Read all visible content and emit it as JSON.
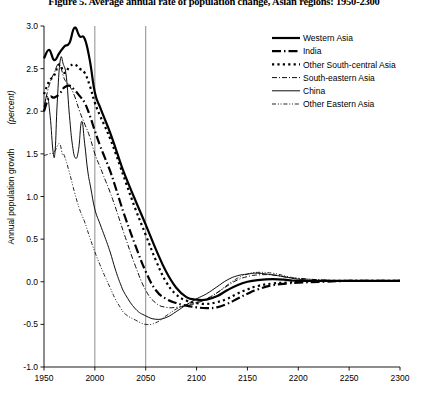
{
  "title": "Figure 5. Average annual rate of population change, Asian regions: 1950-2300",
  "chart_data": {
    "type": "line",
    "title": "Figure 5. Average annual rate of population change, Asian regions: 1950-2300",
    "xlabel": "",
    "ylabel": "Annual population growth",
    "ylabel_unit": "(percent)",
    "xlim": [
      1950,
      2300
    ],
    "ylim": [
      -1.0,
      3.0
    ],
    "xticks": [
      1950,
      2000,
      2050,
      2100,
      2150,
      2200,
      2250,
      2300
    ],
    "yticks": [
      -1.0,
      -0.5,
      0.0,
      0.5,
      1.0,
      1.5,
      2.0,
      2.5,
      3.0
    ],
    "xtick_labels": [
      "1950",
      "2000",
      "2050",
      "2100",
      "2150",
      "2200",
      "2250",
      "2300"
    ],
    "ytick_labels": [
      "-1.0",
      "-0.5",
      "0.0",
      "0.5",
      "1.0",
      "1.5",
      "2.0",
      "2.5",
      "3.0"
    ],
    "grid": "vertical-at-2000-and-2050",
    "gridlines_x": [
      2000,
      2050
    ],
    "gridline_color": "#808080",
    "legend_position": "top-right",
    "line_color": "#000000",
    "series": [
      {
        "name": "Western Asia",
        "style": "solid-thick",
        "stroke_width": 2.2,
        "dasharray": "",
        "x": [
          1950,
          1955,
          1960,
          1965,
          1970,
          1975,
          1980,
          1985,
          1990,
          1995,
          2000,
          2005,
          2010,
          2015,
          2020,
          2025,
          2030,
          2040,
          2050,
          2060,
          2070,
          2080,
          2090,
          2100,
          2110,
          2120,
          2130,
          2140,
          2150,
          2160,
          2175,
          2190,
          2200,
          2225,
          2250,
          2275,
          2300
        ],
        "y": [
          2.62,
          2.72,
          2.6,
          2.68,
          2.76,
          2.8,
          2.98,
          2.88,
          2.85,
          2.6,
          2.22,
          2.05,
          1.9,
          1.75,
          1.58,
          1.4,
          1.24,
          0.95,
          0.67,
          0.38,
          0.12,
          -0.07,
          -0.18,
          -0.21,
          -0.21,
          -0.17,
          -0.1,
          -0.04,
          0.0,
          0.02,
          0.03,
          0.02,
          0.01,
          0.01,
          0.01,
          0.01,
          0.01
        ]
      },
      {
        "name": "India",
        "style": "dash-dot-thick",
        "stroke_width": 2.2,
        "dasharray": "9,3,1.5,3",
        "x": [
          1950,
          1955,
          1960,
          1965,
          1970,
          1975,
          1980,
          1985,
          1990,
          1995,
          2000,
          2005,
          2010,
          2015,
          2020,
          2025,
          2030,
          2040,
          2050,
          2060,
          2070,
          2080,
          2090,
          2100,
          2110,
          2120,
          2130,
          2140,
          2150,
          2160,
          2175,
          2190,
          2200,
          2225,
          2250,
          2275,
          2300
        ],
        "y": [
          2.0,
          2.16,
          2.16,
          2.2,
          2.28,
          2.3,
          2.25,
          2.18,
          2.1,
          1.95,
          1.77,
          1.6,
          1.45,
          1.3,
          1.12,
          0.93,
          0.75,
          0.42,
          0.12,
          -0.1,
          -0.2,
          -0.25,
          -0.28,
          -0.3,
          -0.31,
          -0.3,
          -0.26,
          -0.2,
          -0.14,
          -0.09,
          -0.04,
          -0.02,
          -0.01,
          0.0,
          0.01,
          0.01,
          0.01
        ]
      },
      {
        "name": "Other South-central Asia",
        "style": "dotted-thick",
        "stroke_width": 2.2,
        "dasharray": "2.2,3.2",
        "x": [
          1950,
          1955,
          1960,
          1965,
          1970,
          1975,
          1980,
          1985,
          1990,
          1995,
          2000,
          2005,
          2010,
          2015,
          2020,
          2025,
          2030,
          2040,
          2050,
          2060,
          2070,
          2080,
          2090,
          2100,
          2110,
          2120,
          2130,
          2140,
          2150,
          2160,
          2175,
          2190,
          2200,
          2225,
          2250,
          2275,
          2300
        ],
        "y": [
          2.2,
          2.35,
          2.42,
          2.55,
          2.45,
          2.52,
          2.55,
          2.5,
          2.45,
          2.3,
          2.1,
          1.95,
          1.82,
          1.68,
          1.52,
          1.35,
          1.18,
          0.85,
          0.55,
          0.25,
          0.0,
          -0.15,
          -0.22,
          -0.25,
          -0.26,
          -0.24,
          -0.2,
          -0.14,
          -0.09,
          -0.05,
          -0.02,
          -0.01,
          0.0,
          0.01,
          0.01,
          0.01,
          0.01
        ]
      },
      {
        "name": "South-eastern Asia",
        "style": "dash-dot-thin",
        "stroke_width": 0.95,
        "dasharray": "5,2,1,2",
        "x": [
          1950,
          1955,
          1960,
          1965,
          1970,
          1975,
          1980,
          1985,
          1990,
          1995,
          2000,
          2005,
          2010,
          2015,
          2020,
          2025,
          2030,
          2040,
          2050,
          2060,
          2070,
          2080,
          2090,
          2100,
          2110,
          2120,
          2130,
          2140,
          2150,
          2160,
          2175,
          2190,
          2200,
          2225,
          2250,
          2275,
          2300
        ],
        "y": [
          2.05,
          2.3,
          2.45,
          2.55,
          2.38,
          2.3,
          2.18,
          2.0,
          1.85,
          1.7,
          1.5,
          1.35,
          1.2,
          1.05,
          0.88,
          0.7,
          0.52,
          0.18,
          -0.1,
          -0.25,
          -0.3,
          -0.3,
          -0.28,
          -0.25,
          -0.2,
          -0.13,
          -0.05,
          0.02,
          0.06,
          0.08,
          0.08,
          0.05,
          0.04,
          0.02,
          0.01,
          0.01,
          0.01
        ]
      },
      {
        "name": "China",
        "style": "solid-thin",
        "stroke_width": 0.95,
        "dasharray": "",
        "x": [
          1950,
          1953,
          1956,
          1959,
          1961,
          1963,
          1966,
          1969,
          1972,
          1975,
          1978,
          1981,
          1984,
          1987,
          1990,
          1993,
          1996,
          2000,
          2005,
          2010,
          2015,
          2020,
          2025,
          2030,
          2040,
          2050,
          2060,
          2070,
          2080,
          2090,
          2100,
          2110,
          2120,
          2130,
          2140,
          2150,
          2160,
          2175,
          2190,
          2200,
          2225,
          2250,
          2275,
          2300
        ],
        "y": [
          2.0,
          2.18,
          1.95,
          1.52,
          1.55,
          2.1,
          2.6,
          2.55,
          2.4,
          1.95,
          1.6,
          1.45,
          1.55,
          1.88,
          1.62,
          1.3,
          1.1,
          0.85,
          0.68,
          0.52,
          0.35,
          0.15,
          -0.02,
          -0.15,
          -0.32,
          -0.4,
          -0.44,
          -0.42,
          -0.35,
          -0.27,
          -0.2,
          -0.14,
          -0.06,
          0.02,
          0.07,
          0.09,
          0.1,
          0.08,
          0.05,
          0.03,
          0.01,
          0.01,
          0.01,
          0.01
        ]
      },
      {
        "name": "Other Eastern Asia",
        "style": "dash-dot-dot-thin",
        "stroke_width": 0.85,
        "dasharray": "4,1.8,1,1.8,1,1.8",
        "x": [
          1950,
          1955,
          1960,
          1965,
          1968,
          1970,
          1975,
          1980,
          1985,
          1990,
          1995,
          2000,
          2005,
          2010,
          2015,
          2020,
          2025,
          2030,
          2040,
          2050,
          2060,
          2070,
          2080,
          2090,
          2100,
          2110,
          2120,
          2130,
          2140,
          2150,
          2160,
          2175,
          2190,
          2200,
          2225,
          2250,
          2275,
          2300
        ],
        "y": [
          1.48,
          1.5,
          1.52,
          1.62,
          1.5,
          1.48,
          1.28,
          1.05,
          0.85,
          0.7,
          0.52,
          0.35,
          0.2,
          0.06,
          -0.07,
          -0.2,
          -0.3,
          -0.38,
          -0.45,
          -0.5,
          -0.48,
          -0.4,
          -0.32,
          -0.27,
          -0.24,
          -0.2,
          -0.13,
          -0.04,
          0.04,
          0.09,
          0.11,
          0.1,
          0.06,
          0.04,
          0.02,
          0.01,
          0.01,
          0.01
        ]
      }
    ]
  },
  "legend": {
    "items": [
      {
        "label": "Western Asia"
      },
      {
        "label": "India"
      },
      {
        "label": "Other South-central Asia"
      },
      {
        "label": "South-eastern Asia"
      },
      {
        "label": "China"
      },
      {
        "label": "Other Eastern Asia"
      }
    ]
  }
}
